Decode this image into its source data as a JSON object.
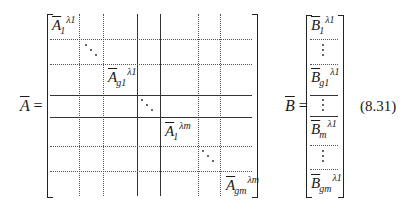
{
  "equation": {
    "number": "(8.31)",
    "lhs_A": "A",
    "lhs_B": "B",
    "equals": "="
  },
  "matrix_A": {
    "blocks": [
      {
        "base": "A",
        "sup": "λ1",
        "sub": "1"
      },
      {
        "base": "A",
        "sup": "λ1",
        "sub": "g1"
      },
      {
        "base": "A",
        "sup": "λm",
        "sub": "1"
      },
      {
        "base": "A",
        "sup": "λm",
        "sub": "gm"
      }
    ],
    "diagonal_ellipses": 3
  },
  "vector_B": {
    "entries": [
      {
        "base": "B",
        "sup": "λ1",
        "sub": "1"
      },
      {
        "base": "B",
        "sup": "λ1",
        "sub": "g1"
      },
      {
        "base": "B",
        "sup": "λ1",
        "sub": "m"
      },
      {
        "base": "B",
        "sup": "λ1",
        "sub": "gm"
      }
    ],
    "vertical_ellipses": 3
  }
}
